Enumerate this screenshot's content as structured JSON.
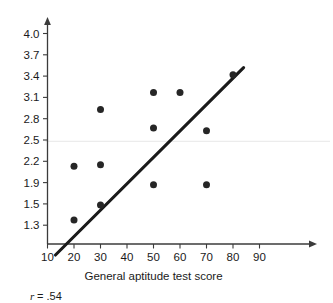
{
  "chart_data": {
    "type": "scatter",
    "title": "",
    "xlabel": "General aptitude test score",
    "ylabel": "",
    "xlim": [
      10,
      95
    ],
    "ylim": [
      1.0,
      4.15
    ],
    "grid": "single faint horizontal line near 2.5",
    "legend": "none",
    "annotations": [
      {
        "name": "correlation",
        "symbol": "r",
        "operator": "=",
        "value": ".54",
        "text": "r = .54"
      }
    ],
    "xticks": [
      10,
      20,
      30,
      40,
      50,
      60,
      70,
      80,
      90
    ],
    "xticklabels": [
      "10",
      "20",
      "30",
      "40",
      "50",
      "60",
      "70",
      "80",
      "90"
    ],
    "yticks": [
      1.3,
      1.5,
      1.9,
      2.2,
      2.5,
      2.8,
      3.1,
      3.4,
      3.7,
      4.0
    ],
    "yticklabels": [
      "1.3",
      "1.5",
      "1.9",
      "2.2",
      "2.5",
      "2.8",
      "3.1",
      "3.4",
      "3.7",
      "4.0"
    ],
    "points": [
      {
        "x": 20,
        "y": 1.35
      },
      {
        "x": 20,
        "y": 2.13
      },
      {
        "x": 30,
        "y": 1.49
      },
      {
        "x": 30,
        "y": 2.15
      },
      {
        "x": 30,
        "y": 2.93
      },
      {
        "x": 50,
        "y": 1.86
      },
      {
        "x": 50,
        "y": 2.67
      },
      {
        "x": 50,
        "y": 3.17
      },
      {
        "x": 60,
        "y": 3.17
      },
      {
        "x": 70,
        "y": 1.86
      },
      {
        "x": 70,
        "y": 2.63
      },
      {
        "x": 80,
        "y": 3.42
      }
    ],
    "regression_line": {
      "name": "best-fit-line",
      "x_start": 13,
      "y_start": 1.02,
      "x_end": 84,
      "y_end": 3.52
    },
    "colors": {
      "point": "#262626",
      "line": "#1a1a1a",
      "axis": "#3b3b3b",
      "grid": "#ececec",
      "background": "#ffffff",
      "text": "#1a1a1a"
    }
  }
}
